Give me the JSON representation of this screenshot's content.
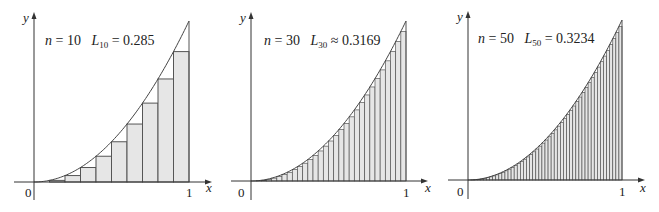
{
  "chart_data": [
    {
      "type": "bar",
      "title": "n = 10  L10 = 0.285",
      "n": 10,
      "function": "y = x^2",
      "approximation": "left endpoint",
      "L_label": "L",
      "L_sub": "10",
      "relation": "=",
      "L_value": "0.285",
      "xlabel": "x",
      "ylabel": "y",
      "xticks": [
        "0",
        "1"
      ],
      "xlim": [
        0,
        1
      ],
      "ylim": [
        0,
        1
      ]
    },
    {
      "type": "bar",
      "title": "n = 30  L30 ≈ 0.3169",
      "n": 30,
      "function": "y = x^2",
      "approximation": "left endpoint",
      "L_label": "L",
      "L_sub": "30",
      "relation": "≈",
      "L_value": "0.3169",
      "xlabel": "x",
      "ylabel": "y",
      "xticks": [
        "0",
        "1"
      ],
      "xlim": [
        0,
        1
      ],
      "ylim": [
        0,
        1
      ]
    },
    {
      "type": "bar",
      "title": "n = 50  L50 = 0.3234",
      "n": 50,
      "function": "y = x^2",
      "approximation": "left endpoint",
      "L_label": "L",
      "L_sub": "50",
      "relation": "=",
      "L_value": "0.3234",
      "xlabel": "x",
      "ylabel": "y",
      "xticks": [
        "0",
        "1"
      ],
      "xlim": [
        0,
        1
      ],
      "ylim": [
        0,
        1
      ]
    }
  ],
  "panels": [
    {
      "n_text": "n",
      "eq": " = 10",
      "L": "L",
      "sub": "10",
      "rel": " = 0.285",
      "zero": "0",
      "one": "1",
      "x": "x",
      "y": "y"
    },
    {
      "n_text": "n",
      "eq": " = 30",
      "L": "L",
      "sub": "30",
      "rel": " ≈ 0.3169",
      "zero": "0",
      "one": "1",
      "x": "x",
      "y": "y"
    },
    {
      "n_text": "n",
      "eq": " = 50",
      "L": "L",
      "sub": "50",
      "rel": " = 0.3234",
      "zero": "0",
      "one": "1",
      "x": "x",
      "y": "y"
    }
  ],
  "colors": {
    "fill": "#e6e6e6",
    "stroke": "#555555",
    "axis": "#333333"
  }
}
